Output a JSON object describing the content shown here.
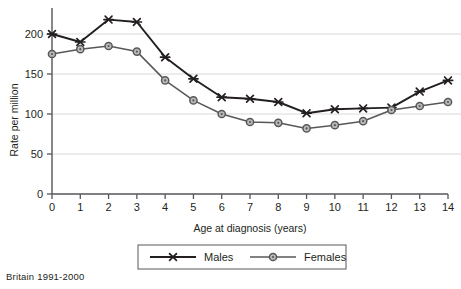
{
  "caption": "Britain 1991-2000",
  "chart_data": {
    "type": "line",
    "title": "",
    "xlabel": "Age at diagnosis (years)",
    "ylabel": "Rate per million",
    "categories": [
      0,
      1,
      2,
      3,
      4,
      5,
      6,
      7,
      8,
      9,
      10,
      11,
      12,
      13,
      14
    ],
    "x": [
      0,
      1,
      2,
      3,
      4,
      5,
      6,
      7,
      8,
      9,
      10,
      11,
      12,
      13,
      14
    ],
    "xlim": [
      0,
      14
    ],
    "ylim": [
      0,
      225
    ],
    "yticks": [
      0,
      50,
      100,
      150,
      200
    ],
    "xticks": [
      0,
      1,
      2,
      3,
      4,
      5,
      6,
      7,
      8,
      9,
      10,
      11,
      12,
      13,
      14
    ],
    "grid": "horizontal",
    "legend_position": "bottom",
    "series": [
      {
        "name": "Males",
        "color": "#231f20",
        "marker": "x-cross",
        "values": [
          200,
          190,
          218,
          215,
          171,
          144,
          121,
          119,
          115,
          101,
          106,
          107,
          108,
          128,
          142
        ]
      },
      {
        "name": "Females",
        "color": "#58585a",
        "marker": "circle",
        "values": [
          175,
          181,
          185,
          178,
          142,
          117,
          100,
          90,
          89,
          82,
          86,
          91,
          105,
          110,
          115
        ]
      }
    ],
    "legend": [
      "Males",
      "Females"
    ],
    "ytick_labels": [
      "0",
      "50",
      "100",
      "150",
      "200"
    ],
    "xtick_labels": [
      "0",
      "1",
      "2",
      "3",
      "4",
      "5",
      "6",
      "7",
      "8",
      "9",
      "10",
      "11",
      "12",
      "13",
      "14"
    ]
  }
}
